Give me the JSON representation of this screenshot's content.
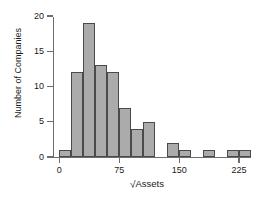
{
  "chart_data": {
    "type": "bar",
    "title": "",
    "xlabel": "√Assets",
    "ylabel": "Number of Companies",
    "bin_width": 15,
    "bin_starts": [
      0,
      15,
      30,
      45,
      60,
      75,
      90,
      105,
      135,
      150,
      180,
      210,
      225
    ],
    "categories": [
      "0-15",
      "15-30",
      "30-45",
      "45-60",
      "60-75",
      "75-90",
      "90-105",
      "105-120",
      "135-150",
      "150-165",
      "180-195",
      "210-225",
      "225-240"
    ],
    "values": [
      1,
      12,
      19,
      13,
      12,
      7,
      4,
      5,
      2,
      1,
      1,
      1,
      1
    ],
    "xlim": [
      -8,
      240
    ],
    "ylim": [
      0,
      20
    ],
    "xticks": [
      0,
      75,
      150,
      225
    ],
    "xtick_labels": [
      "0",
      "75",
      "150",
      "225"
    ],
    "yticks": [
      0,
      5,
      10,
      15,
      20
    ],
    "ytick_labels": [
      "0",
      "5",
      "10",
      "15",
      "20"
    ],
    "grid": false,
    "legend": null,
    "bar_color": "#ababab",
    "bar_edge_color": "#4a4a4a",
    "axis_color": "#6d6d6d"
  },
  "axes": {
    "y_axis_title": "Number of Companies",
    "x_axis_title_prefix": "√",
    "x_axis_title_text": "Assets"
  }
}
